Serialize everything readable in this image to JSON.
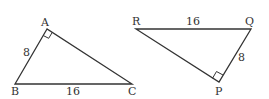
{
  "triangles": [
    {
      "name": "ABC",
      "vertices": {
        "A": "A",
        "B": "B",
        "C": "C"
      },
      "right_angle_at": "A",
      "sides": {
        "AB": "8",
        "BC": "16"
      }
    },
    {
      "name": "PQR",
      "vertices": {
        "R": "R",
        "Q": "Q",
        "P": "P"
      },
      "right_angle_at": "P",
      "sides": {
        "RQ": "16",
        "QP": "8"
      }
    }
  ],
  "colors": {
    "stroke": "#333333",
    "background": "#ffffff"
  }
}
